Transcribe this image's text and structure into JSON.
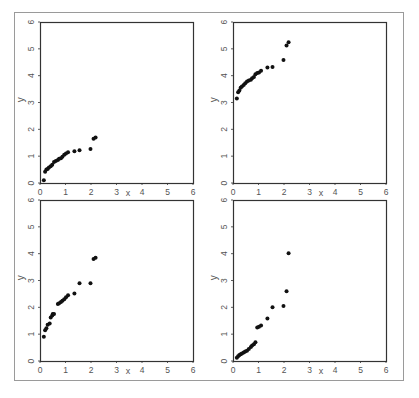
{
  "figure": {
    "frame_color": "#9a9a9a",
    "axis_color": "#333333",
    "point_color": "#111111"
  },
  "chart_data": [
    {
      "type": "scatter",
      "panel": "top-left",
      "title": "",
      "xlabel": "x",
      "ylabel": "y",
      "xlim": [
        0,
        6
      ],
      "ylim": [
        0,
        6
      ],
      "xticks": [
        "0",
        "1",
        "2",
        "3",
        "4",
        "5",
        "6"
      ],
      "yticks": [
        "0",
        "1",
        "2",
        "3",
        "4",
        "5",
        "6"
      ],
      "grid": false,
      "x": [
        0.15,
        0.2,
        0.25,
        0.3,
        0.35,
        0.42,
        0.48,
        0.55,
        0.62,
        0.7,
        0.75,
        0.82,
        0.88,
        0.95,
        1.02,
        1.1,
        1.35,
        1.55,
        1.98,
        2.1,
        2.18
      ],
      "y": [
        0.1,
        0.42,
        0.5,
        0.52,
        0.58,
        0.62,
        0.68,
        0.78,
        0.82,
        0.86,
        0.9,
        0.92,
        0.98,
        1.05,
        1.1,
        1.15,
        1.18,
        1.22,
        1.27,
        1.65,
        1.7
      ]
    },
    {
      "type": "scatter",
      "panel": "top-right",
      "title": "",
      "xlabel": "x",
      "ylabel": "y",
      "xlim": [
        0,
        6
      ],
      "ylim": [
        0,
        6
      ],
      "xticks": [
        "0",
        "1",
        "2",
        "3",
        "4",
        "5",
        "6"
      ],
      "yticks": [
        "0",
        "1",
        "2",
        "3",
        "4",
        "5",
        "6"
      ],
      "grid": false,
      "x": [
        0.15,
        0.2,
        0.25,
        0.3,
        0.35,
        0.42,
        0.48,
        0.55,
        0.62,
        0.7,
        0.75,
        0.82,
        0.88,
        0.95,
        1.02,
        1.1,
        1.35,
        1.55,
        1.98,
        2.1,
        2.18
      ],
      "y": [
        3.15,
        3.38,
        3.45,
        3.55,
        3.6,
        3.65,
        3.72,
        3.78,
        3.82,
        3.85,
        3.9,
        3.95,
        4.05,
        4.1,
        4.12,
        4.18,
        4.3,
        4.32,
        4.58,
        5.12,
        5.25
      ]
    },
    {
      "type": "scatter",
      "panel": "bottom-left",
      "title": "",
      "xlabel": "x",
      "ylabel": "y",
      "xlim": [
        0,
        6
      ],
      "ylim": [
        0,
        6
      ],
      "xticks": [
        "0",
        "1",
        "2",
        "3",
        "4",
        "5",
        "6"
      ],
      "yticks": [
        "0",
        "1",
        "2",
        "3",
        "4",
        "5",
        "6"
      ],
      "grid": false,
      "x": [
        0.15,
        0.2,
        0.25,
        0.3,
        0.38,
        0.42,
        0.48,
        0.5,
        0.55,
        0.7,
        0.75,
        0.82,
        0.88,
        0.95,
        1.02,
        1.1,
        1.35,
        1.55,
        1.98,
        2.1,
        2.18
      ],
      "y": [
        0.9,
        1.15,
        1.22,
        1.35,
        1.4,
        1.62,
        1.7,
        1.75,
        1.75,
        2.12,
        2.15,
        2.2,
        2.25,
        2.3,
        2.38,
        2.45,
        2.52,
        2.9,
        2.9,
        3.8,
        3.85
      ]
    },
    {
      "type": "scatter",
      "panel": "bottom-right",
      "title": "",
      "xlabel": "x",
      "ylabel": "y",
      "xlim": [
        0,
        6
      ],
      "ylim": [
        0,
        6
      ],
      "xticks": [
        "0",
        "1",
        "2",
        "3",
        "4",
        "5",
        "6"
      ],
      "yticks": [
        "0",
        "1",
        "2",
        "3",
        "4",
        "5",
        "6"
      ],
      "grid": false,
      "x": [
        0.15,
        0.2,
        0.25,
        0.3,
        0.35,
        0.42,
        0.48,
        0.55,
        0.62,
        0.7,
        0.75,
        0.82,
        0.88,
        0.95,
        1.02,
        1.1,
        1.35,
        1.55,
        1.98,
        2.1,
        2.18
      ],
      "y": [
        0.12,
        0.18,
        0.22,
        0.25,
        0.28,
        0.32,
        0.35,
        0.38,
        0.45,
        0.52,
        0.58,
        0.62,
        0.7,
        1.25,
        1.28,
        1.32,
        1.58,
        2.0,
        2.05,
        2.6,
        4.02
      ]
    }
  ]
}
